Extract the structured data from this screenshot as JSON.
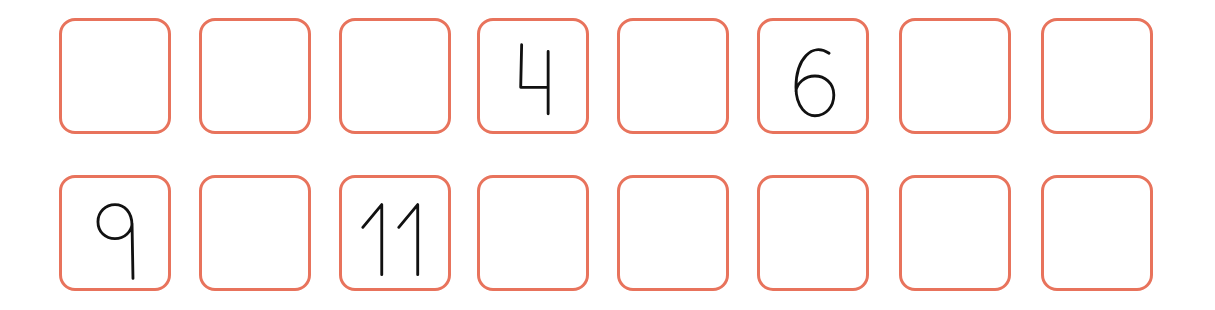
{
  "worksheet": {
    "border_color": "#e8735c",
    "digit_color": "#111111",
    "rows": [
      {
        "cells": [
          {
            "value": ""
          },
          {
            "value": ""
          },
          {
            "value": ""
          },
          {
            "value": "4"
          },
          {
            "value": ""
          },
          {
            "value": "6"
          },
          {
            "value": ""
          },
          {
            "value": ""
          }
        ]
      },
      {
        "cells": [
          {
            "value": "9"
          },
          {
            "value": ""
          },
          {
            "value": "11"
          },
          {
            "value": ""
          },
          {
            "value": ""
          },
          {
            "value": ""
          },
          {
            "value": ""
          },
          {
            "value": ""
          }
        ]
      }
    ]
  }
}
